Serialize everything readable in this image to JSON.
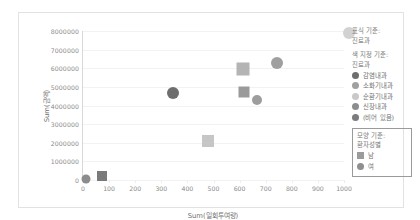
{
  "chart_data": {
    "type": "scatter",
    "title": "",
    "xlabel": "Sum(일회투여량)",
    "ylabel": "Sum(금액)",
    "xlim": [
      0,
      1000
    ],
    "ylim": [
      0,
      8000000
    ],
    "xticks": [
      "0",
      "100",
      "200",
      "300",
      "400",
      "500",
      "600",
      "700",
      "800",
      "900",
      "1000"
    ],
    "yticks": [
      "0",
      "1000000",
      "2000000",
      "3000000",
      "4000000",
      "5000000",
      "6000000",
      "7000000",
      "8000000"
    ],
    "grid": true,
    "legend_position": "right",
    "shape_encoding": {
      "남": "square",
      "여": "circle"
    },
    "points": [
      {
        "x": 10,
        "y": 50000,
        "shape": "circle",
        "color": "#8c8c8c",
        "size": 9,
        "series": "여",
        "category": "감염내과"
      },
      {
        "x": 72,
        "y": 240000,
        "shape": "square",
        "color": "#7a7a7a",
        "size": 10,
        "series": "남",
        "category": "감염내과"
      },
      {
        "x": 345,
        "y": 4650000,
        "shape": "circle",
        "color": "#6e6e6e",
        "size": 12,
        "series": "여",
        "category": "감염내과"
      },
      {
        "x": 480,
        "y": 2080000,
        "shape": "square",
        "color": "#c6c6c6",
        "size": 12,
        "series": "남",
        "category": "순환기내과"
      },
      {
        "x": 612,
        "y": 5980000,
        "shape": "square",
        "color": "#b4b4b4",
        "size": 13,
        "series": "남",
        "category": "소화기내과"
      },
      {
        "x": 618,
        "y": 4720000,
        "shape": "square",
        "color": "#9a9a9a",
        "size": 11,
        "series": "남",
        "category": "신장내과"
      },
      {
        "x": 668,
        "y": 4270000,
        "shape": "circle",
        "color": "#9d9d9d",
        "size": 10,
        "series": "여",
        "category": "신장내과"
      },
      {
        "x": 745,
        "y": 6300000,
        "shape": "circle",
        "color": "#9f9f9f",
        "size": 12,
        "series": "여",
        "category": "소화기내과"
      },
      {
        "x": 1018,
        "y": 7900000,
        "shape": "circle",
        "color": "#d2d2d2",
        "size": 12,
        "series": "여",
        "category": "(비어 있음)"
      }
    ]
  },
  "legend": {
    "mark_caption_line1": "표식 기준:",
    "mark_caption_line2": "진료과",
    "color_caption_line1": "색 지정 기준:",
    "color_caption_line2": "진료과",
    "color_items": [
      {
        "label": "감염내과",
        "color": "#6e6e6e"
      },
      {
        "label": "소화기내과",
        "color": "#a0a0a0"
      },
      {
        "label": "순환기내과",
        "color": "#c9c9c9"
      },
      {
        "label": "신장내과",
        "color": "#8d8d8d"
      },
      {
        "label": "(비어 있음)",
        "color": "#7c7c7c"
      }
    ],
    "shape_caption_line1": "모양 기준:",
    "shape_caption_line2": "환자성별",
    "shape_items": [
      {
        "label": "남",
        "shape": "square",
        "color": "#9b9b9b"
      },
      {
        "label": "여",
        "shape": "circle",
        "color": "#8f8f8f"
      }
    ]
  }
}
